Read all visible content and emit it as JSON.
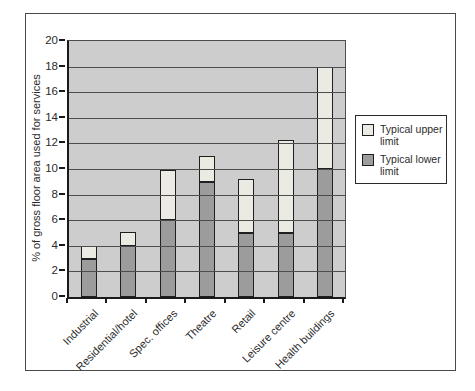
{
  "figure": {
    "background": "#ffffff",
    "border_color": "#4a4a4a"
  },
  "chart_data": {
    "type": "bar",
    "subtype": "stacked-range",
    "title": "",
    "xlabel": "",
    "ylabel": "% of gross floor area used for services",
    "ylim": [
      0,
      20
    ],
    "ytick_step": 2,
    "yticks": [
      0,
      2,
      4,
      6,
      8,
      10,
      12,
      14,
      16,
      18,
      20
    ],
    "grid": true,
    "plot_background": "#cdcdcd",
    "gridline_color": "#4d4d4d",
    "axis_color": "#1a1a1a",
    "categories": [
      "Industrial",
      "Residential/hotel",
      "Spec. offices",
      "Theatre",
      "Retail",
      "Leisure centre",
      "Health buildings"
    ],
    "series": [
      {
        "name": "Typical lower limit",
        "role": "lower",
        "color": "#9c9c9c",
        "values": [
          3,
          4,
          6,
          9,
          5,
          5,
          10
        ]
      },
      {
        "name": "Typical upper limit",
        "role": "upper-bar-top",
        "color": "#ebeae3",
        "values": [
          4,
          5.1,
          9.9,
          11,
          9.2,
          12.3,
          18
        ]
      }
    ],
    "legend_position": "right"
  },
  "legend": {
    "items": [
      {
        "label": "Typical upper limit",
        "color": "#ebeae3"
      },
      {
        "label": "Typical lower limit",
        "color": "#9c9c9c"
      }
    ]
  }
}
